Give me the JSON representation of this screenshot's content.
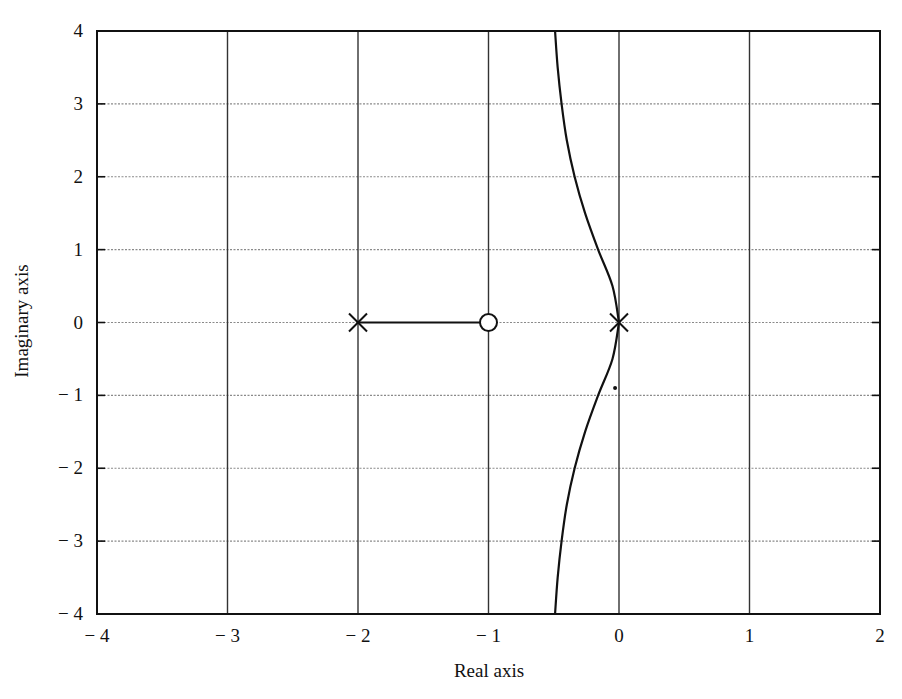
{
  "chart_data": {
    "type": "line",
    "title": "",
    "xlabel": "Real axis",
    "ylabel": "Imaginary axis",
    "xlim": [
      -4,
      2
    ],
    "ylim": [
      -4,
      4
    ],
    "grid": true,
    "legend": null,
    "x_ticks": [
      -4,
      -3,
      -2,
      -1,
      0,
      1,
      2
    ],
    "y_ticks": [
      -4,
      -3,
      -2,
      -1,
      0,
      1,
      2,
      3,
      4
    ],
    "x_tick_labels": [
      "− 4",
      "− 3",
      "− 2",
      "− 1",
      "0",
      "1",
      "2"
    ],
    "y_tick_labels": [
      "− 4",
      "− 3",
      "− 2",
      "− 1",
      "0",
      "1",
      "2",
      "3",
      "4"
    ],
    "poles": [
      [
        -2,
        0
      ],
      [
        0,
        0
      ]
    ],
    "zeros": [
      [
        -1,
        0
      ]
    ],
    "series": [
      {
        "name": "real-axis branch",
        "x": [
          -2,
          -1
        ],
        "y": [
          0,
          0
        ]
      },
      {
        "name": "upper branch",
        "x": [
          0,
          -0.05,
          -0.16,
          -0.26,
          -0.34,
          -0.4,
          -0.44,
          -0.47,
          -0.49
        ],
        "y": [
          0,
          0.5,
          1.0,
          1.5,
          2.0,
          2.5,
          3.0,
          3.5,
          4.0
        ]
      },
      {
        "name": "lower branch",
        "x": [
          0,
          -0.05,
          -0.16,
          -0.26,
          -0.34,
          -0.4,
          -0.44,
          -0.47,
          -0.49
        ],
        "y": [
          0,
          -0.5,
          -1.0,
          -1.5,
          -2.0,
          -2.5,
          -3.0,
          -3.5,
          -4.0
        ]
      }
    ],
    "annotations": [
      {
        "type": "dot",
        "x": -0.03,
        "y": -0.9
      }
    ],
    "colors": {
      "line": "#111111",
      "grid_vertical": "#333333",
      "grid_horizontal": "#8a8a8a",
      "frame": "#111111"
    }
  }
}
